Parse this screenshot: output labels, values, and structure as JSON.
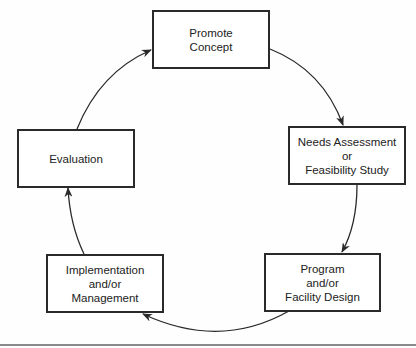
{
  "diagram": {
    "type": "cycle",
    "nodes": [
      {
        "id": "promote",
        "lines": [
          "Promote",
          "Concept"
        ]
      },
      {
        "id": "needs",
        "lines": [
          "Needs Assessment",
          "or",
          "Feasibility Study"
        ]
      },
      {
        "id": "program",
        "lines": [
          "Program",
          "and/or",
          "Facility Design"
        ]
      },
      {
        "id": "implementation",
        "lines": [
          "Implementation",
          "and/or",
          "Management"
        ]
      },
      {
        "id": "evaluation",
        "lines": [
          "Evaluation"
        ]
      }
    ],
    "edges": [
      {
        "from": "promote",
        "to": "needs"
      },
      {
        "from": "needs",
        "to": "program"
      },
      {
        "from": "program",
        "to": "implementation"
      },
      {
        "from": "implementation",
        "to": "evaluation"
      },
      {
        "from": "evaluation",
        "to": "promote"
      }
    ],
    "colors": {
      "stroke": "#2a2a2a",
      "background": "#fefefe",
      "rule": "#8a8a8a"
    }
  }
}
